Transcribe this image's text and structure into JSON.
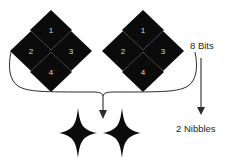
{
  "diagram": {
    "background_color": "#ffffff",
    "shape_color": "#0b0b0b",
    "number_color": "#d8d8d8",
    "line_color": "#2b2b2b",
    "labels": {
      "bits": "8 Bits",
      "nibbles": "2 Nibbles"
    },
    "groups": [
      {
        "name": "left-bit-group",
        "bits": [
          {
            "label": "1",
            "position": "top"
          },
          {
            "label": "2",
            "position": "left"
          },
          {
            "label": "3",
            "position": "right"
          },
          {
            "label": "4",
            "position": "bottom"
          }
        ]
      },
      {
        "name": "right-bit-group",
        "bits": [
          {
            "label": "1",
            "position": "top"
          },
          {
            "label": "2",
            "position": "left"
          },
          {
            "label": "3",
            "position": "right"
          },
          {
            "label": "4",
            "position": "bottom"
          }
        ]
      }
    ],
    "stars": [
      {
        "name": "left-nibble-star"
      },
      {
        "name": "right-nibble-star"
      }
    ]
  }
}
